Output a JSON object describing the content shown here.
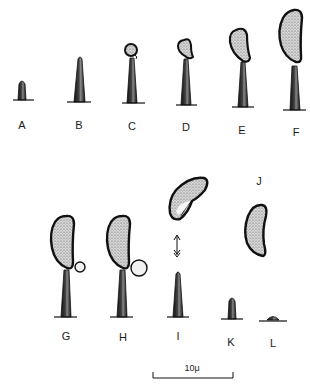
{
  "figure": {
    "type": "developmental-stage-illustration",
    "panels": [
      {
        "label": "A",
        "stage": "short sterigma primordium"
      },
      {
        "label": "B",
        "stage": "elongated sterigma"
      },
      {
        "label": "C",
        "stage": "sterigma with small spore initial"
      },
      {
        "label": "D",
        "stage": "sterigma with enlarging spore"
      },
      {
        "label": "E",
        "stage": "sterigma with curved spore"
      },
      {
        "label": "F",
        "stage": "sterigma with mature curved spore"
      },
      {
        "label": "G",
        "stage": "mature spore with small hilar drop"
      },
      {
        "label": "H",
        "stage": "mature spore with enlarged hilar drop"
      },
      {
        "label": "I",
        "stage": "spore discharged (arrow) from sterigma"
      },
      {
        "label": "J",
        "stage": "free spore"
      },
      {
        "label": "K",
        "stage": "collapsing sterigma"
      },
      {
        "label": "L",
        "stage": "sterigma remnant"
      }
    ],
    "scale_bar": {
      "label": "10μ"
    }
  },
  "colors": {
    "ink": "#1a1a1a",
    "stipple": "#6a6a6a",
    "background": "#ffffff"
  }
}
